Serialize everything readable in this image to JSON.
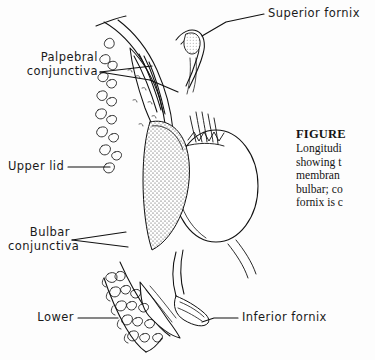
{
  "figure": {
    "background_color": "#fdfdfd",
    "ink_color": "#111111"
  },
  "labels": {
    "superior_fornix": "Superior fornix",
    "palpebral_conjunctiva_l1": "Palpebral",
    "palpebral_conjunctiva_l2": "conjunctiva",
    "upper_lid": "Upper lid",
    "bulbar_conjunctiva_l1": "Bulbar",
    "bulbar_conjunctiva_l2": "conjunctiva",
    "lower_lid": "Lower",
    "inferior_fornix": "Inferior fornix"
  },
  "caption": {
    "title": "FIGURE",
    "lines": [
      "Longitudi",
      "showing t",
      "membran",
      "bulbar; co",
      "fornix is c"
    ]
  }
}
